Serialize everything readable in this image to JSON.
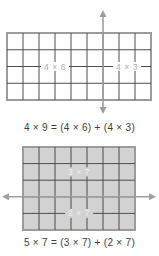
{
  "colors": {
    "background": "#ffffff",
    "grid_border": "#9b9b9b",
    "grid_line": "#4d4d4d",
    "arrow": "#9e9e9e",
    "top_grid_fill": "#ffffff",
    "bottom_grid_fill": "#d2d2d2",
    "top_label_color": "#aeaeae",
    "bottom_label_color": "#efefef",
    "equation_color": "#3c3c3c"
  },
  "figure_top": {
    "columns": 9,
    "rows": 4,
    "split_after_column": 6,
    "arrow_direction": "vertical",
    "label_left": "4 × 6",
    "label_right": "4 × 3",
    "equation": "4 × 9 = (4 × 6) + (4 × 3)"
  },
  "figure_bottom": {
    "columns": 7,
    "rows": 5,
    "split_after_row": 3,
    "arrow_direction": "horizontal",
    "label_top": "3 × 7",
    "label_bottom": "2 × 7",
    "equation": "5 × 7 = (3 × 7) + (2 × 7)"
  }
}
